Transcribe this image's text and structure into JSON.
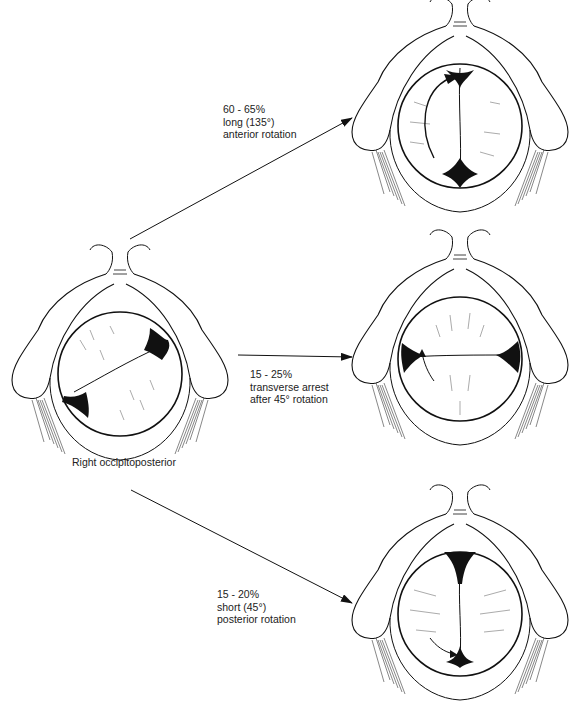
{
  "figure": {
    "source_label": "Right occipitoposterior",
    "outcomes": [
      {
        "id": "anterior",
        "percent": "60 - 65%",
        "line2": "long (135°)",
        "line3": "anterior rotation"
      },
      {
        "id": "transverse",
        "percent": "15 - 25%",
        "line2": "transverse arrest",
        "line3": "after 45° rotation"
      },
      {
        "id": "posterior",
        "percent": "15 - 20%",
        "line2": "short (45°)",
        "line3": "posterior rotation"
      }
    ]
  },
  "colors": {
    "ink": "#111111",
    "paper": "#ffffff"
  }
}
